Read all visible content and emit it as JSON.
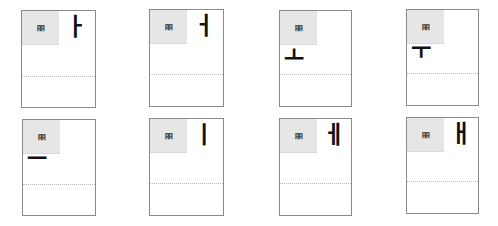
{
  "cards": [
    {
      "consonant": "ㅃ",
      "vowel": "ㅏ",
      "vowel_position": "right"
    },
    {
      "consonant": "ㅃ",
      "vowel": "ㅓ",
      "vowel_position": "right"
    },
    {
      "consonant": "ㅃ",
      "vowel": "ㅗ",
      "vowel_position": "below"
    },
    {
      "consonant": "ㅃ",
      "vowel": "ㅜ",
      "vowel_position": "below"
    },
    {
      "consonant": "ㅃ",
      "vowel": "ㅡ",
      "vowel_position": "below"
    },
    {
      "consonant": "ㅃ",
      "vowel": "ㅣ",
      "vowel_position": "right"
    },
    {
      "consonant": "ㅃ",
      "vowel": "ㅔ",
      "vowel_position": "right"
    },
    {
      "consonant": "ㅃ",
      "vowel": "ㅐ",
      "vowel_position": "right"
    }
  ],
  "colors": {
    "border": "#8a8a8a",
    "consonant_box_bg": "#e6e6e6",
    "consonant_text": "#555555",
    "vowel_text": "#111111"
  }
}
